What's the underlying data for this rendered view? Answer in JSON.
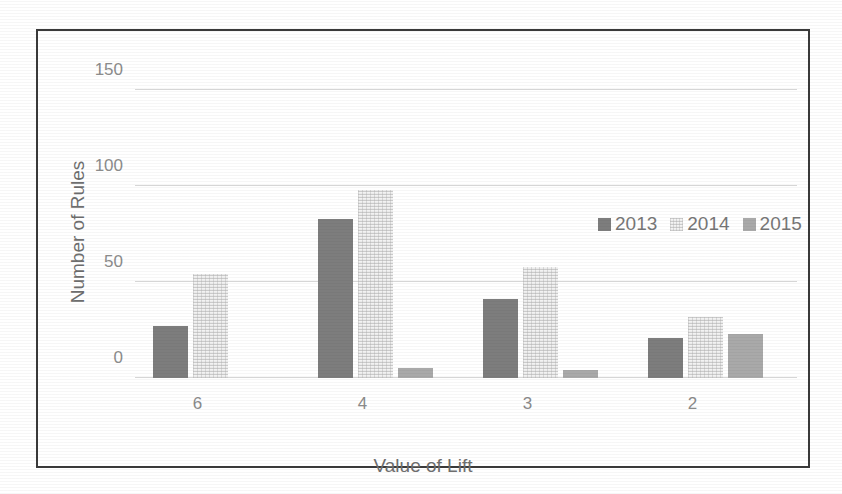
{
  "chart_data": {
    "type": "bar",
    "title": "",
    "xlabel": "Value of Lift",
    "ylabel": "Number of Rules",
    "categories": [
      "6",
      "4",
      "3",
      "2"
    ],
    "series": [
      {
        "name": "2013",
        "color": "#7d7d7d",
        "values": [
          27,
          83,
          41,
          21
        ]
      },
      {
        "name": "2014",
        "color": "#f2f2f2",
        "values": [
          54,
          98,
          58,
          32
        ]
      },
      {
        "name": "2015",
        "color": "#a9a9a9",
        "values": [
          0,
          5,
          4,
          23
        ]
      }
    ],
    "ylim": [
      0,
      152
    ],
    "yticks": [
      0,
      50,
      100,
      150
    ],
    "ytick_labels": [
      "0",
      "50",
      "100",
      "150"
    ],
    "grid": true,
    "legend_position": "top-right"
  },
  "legend": {
    "items": [
      {
        "label": "2013"
      },
      {
        "label": "2014"
      },
      {
        "label": "2015"
      }
    ]
  }
}
